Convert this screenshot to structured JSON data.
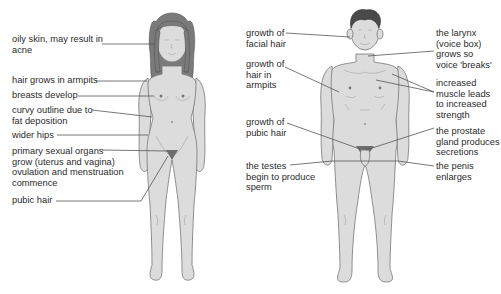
{
  "female": {
    "labels": [
      {
        "id": "oily-skin",
        "text": "oily skin, may result in\nacne",
        "x": 12,
        "y": 34
      },
      {
        "id": "armpit-hair",
        "text": "hair grows in armpits",
        "x": 12,
        "y": 75
      },
      {
        "id": "breasts",
        "text": "breasts develop",
        "x": 12,
        "y": 90
      },
      {
        "id": "curvy-outline",
        "text": "curvy outline due to\nfat deposition",
        "x": 12,
        "y": 105
      },
      {
        "id": "wider-hips",
        "text": "wider hips",
        "x": 12,
        "y": 130
      },
      {
        "id": "primary-organs",
        "text": "primary sexual organs\ngrow (uterus and vagina)\novulation and menstruation\ncommence",
        "x": 12,
        "y": 146
      },
      {
        "id": "pubic-hair",
        "text": "pubic hair",
        "x": 12,
        "y": 195
      }
    ]
  },
  "male": {
    "labels": [
      {
        "id": "facial-hair",
        "text": "growth of\nfacial hair",
        "x": 246,
        "y": 28
      },
      {
        "id": "armpit-hair",
        "text": "growth of\nhair in\narmpits",
        "x": 246,
        "y": 59
      },
      {
        "id": "pubic-hair",
        "text": "growth of\npubic hair",
        "x": 246,
        "y": 117
      },
      {
        "id": "testes",
        "text": "the testes\nbegin to produce\nsperm",
        "x": 246,
        "y": 161
      },
      {
        "id": "larynx",
        "text": "the larynx\n(voice box)\ngrows so\nvoice 'breaks'",
        "x": 436,
        "y": 28
      },
      {
        "id": "muscle",
        "text": "increased\nmuscle leads\nto increased\nstrength",
        "x": 436,
        "y": 78
      },
      {
        "id": "prostate",
        "text": "the prostate\ngland produces\nsecretions",
        "x": 436,
        "y": 126
      },
      {
        "id": "penis",
        "text": "the penis\nenlarges",
        "x": 436,
        "y": 161
      }
    ]
  }
}
